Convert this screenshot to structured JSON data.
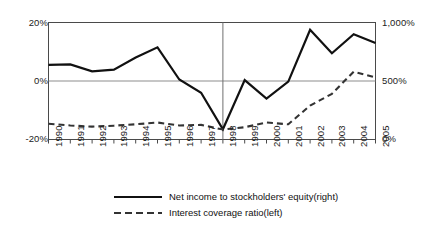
{
  "chart_data": {
    "type": "line",
    "title": "",
    "xlabel": "",
    "categories": [
      "1990",
      "1991",
      "1992",
      "1993",
      "1994",
      "1995",
      "1996",
      "1997",
      "1998",
      "1999",
      "2000",
      "2001",
      "2002",
      "2003",
      "2004",
      "2005"
    ],
    "grid": true,
    "legend_position": "bottom",
    "axes": {
      "left": {
        "label": "",
        "ylim": [
          -20,
          20
        ],
        "ticks": [
          -20,
          0,
          20
        ],
        "tick_labels": [
          "-20%",
          "0%",
          "20%"
        ],
        "unit": "%"
      },
      "right": {
        "label": "",
        "ylim": [
          0,
          1000
        ],
        "ticks": [
          0,
          500,
          1000
        ],
        "tick_labels": [
          "0%",
          "500%",
          "1,000%"
        ],
        "unit": "%"
      }
    },
    "annotations": [
      {
        "type": "vertical-line",
        "x": "1998"
      }
    ],
    "series": [
      {
        "name": "Net income to stockholders' equity(right)",
        "legend_label": "Net income to stockholders' equity(right)",
        "style": "solid",
        "color": "#111111",
        "axis": "left",
        "values": [
          5.5,
          5.7,
          3.3,
          3.9,
          8.0,
          11.5,
          0.5,
          -4.0,
          -16.5,
          0.3,
          -6.0,
          -0.2,
          17.5,
          9.5,
          16.0,
          13.0
        ]
      },
      {
        "name": "Interest coverage ratio(left)",
        "legend_label": "Interest coverage ratio(left)",
        "style": "dashed",
        "color": "#333333",
        "axis": "right",
        "values": [
          135,
          120,
          110,
          118,
          130,
          145,
          120,
          125,
          85,
          105,
          145,
          130,
          290,
          390,
          580,
          530
        ]
      }
    ]
  }
}
